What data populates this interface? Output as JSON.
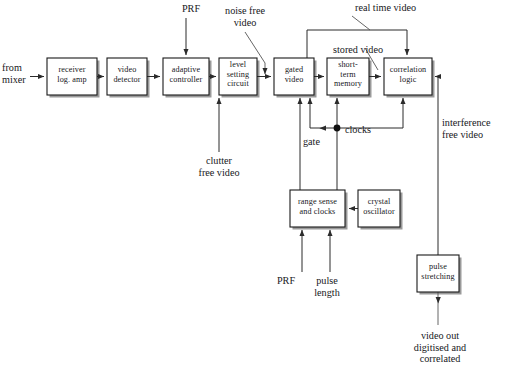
{
  "diagram": {
    "canvas": {
      "width": 507,
      "height": 387
    },
    "colors": {
      "background": "#ffffff",
      "box_stroke": "#1a1a1a",
      "box_fill": "#ffffff",
      "box_shadow": "#9a9a9a",
      "wire": "#2b2b2b",
      "text": "#17171b"
    },
    "blocks": [
      {
        "id": "receiver",
        "label": "receiver\nlog. amp",
        "x": 47,
        "y": 58,
        "w": 50,
        "h": 37
      },
      {
        "id": "detector",
        "label": "video\ndetector",
        "x": 107,
        "y": 58,
        "w": 40,
        "h": 37
      },
      {
        "id": "adaptive",
        "label": "adaptive\ncontroller",
        "x": 163,
        "y": 58,
        "w": 46,
        "h": 37
      },
      {
        "id": "levelset",
        "label": "level\nsetting\ncircuit",
        "x": 219,
        "y": 58,
        "w": 38,
        "h": 37
      },
      {
        "id": "gated",
        "label": "gated\nvideo",
        "x": 274,
        "y": 58,
        "w": 40,
        "h": 37
      },
      {
        "id": "shortterm",
        "label": "short-\nterm\nmemory",
        "x": 327,
        "y": 58,
        "w": 42,
        "h": 37
      },
      {
        "id": "correlation",
        "label": "correlation\nlogic",
        "x": 384,
        "y": 58,
        "w": 48,
        "h": 37
      },
      {
        "id": "rangesense",
        "label": "range sense\nand clocks",
        "x": 290,
        "y": 190,
        "w": 55,
        "h": 37
      },
      {
        "id": "crystal",
        "label": "crystal\noscillator",
        "x": 358,
        "y": 190,
        "w": 42,
        "h": 37
      },
      {
        "id": "pulsestr",
        "label": "pulse\nstretching",
        "x": 417,
        "y": 255,
        "w": 42,
        "h": 37
      }
    ],
    "annotations": [
      {
        "id": "from-mixer",
        "text": "from\nmixer",
        "x": 2,
        "y": 62,
        "w": 42,
        "align": "left"
      },
      {
        "id": "prf-top",
        "text": "PRF",
        "x": 172,
        "y": 3,
        "w": 38,
        "align": "center"
      },
      {
        "id": "noise-free-video",
        "text": "noise free\nvideo",
        "x": 214,
        "y": 5,
        "w": 62,
        "align": "center"
      },
      {
        "id": "real-time-video",
        "text": "real time video",
        "x": 355,
        "y": 2,
        "w": 84,
        "align": "left"
      },
      {
        "id": "stored-video",
        "text": "stored video",
        "x": 333,
        "y": 44,
        "w": 70,
        "align": "left"
      },
      {
        "id": "clutter-free-video",
        "text": "clutter\nfree video",
        "x": 185,
        "y": 155,
        "w": 68,
        "align": "center"
      },
      {
        "id": "gate",
        "text": "gate",
        "x": 293,
        "y": 138,
        "w": 30,
        "align": "left"
      },
      {
        "id": "clocks",
        "text": "clocks",
        "x": 345,
        "y": 124,
        "w": 40,
        "align": "left"
      },
      {
        "id": "interference-free",
        "text": "interference\nfree video",
        "x": 442,
        "y": 117,
        "w": 64,
        "align": "left"
      },
      {
        "id": "prf-bottom",
        "text": "PRF",
        "x": 270,
        "y": 275,
        "w": 32,
        "align": "center"
      },
      {
        "id": "pulse-length",
        "text": "pulse\nlength",
        "x": 307,
        "y": 275,
        "w": 40,
        "align": "center"
      },
      {
        "id": "video-out",
        "text": "video out\ndigitised and\ncorrelated",
        "x": 398,
        "y": 330,
        "w": 84,
        "align": "center"
      }
    ],
    "signal_flow": [
      "from mixer -> receiver log. amp",
      "receiver log. amp -> video detector",
      "video detector -> adaptive controller",
      "adaptive controller -> level setting circuit",
      "level setting circuit -> gated video (noise free video)",
      "gated video -> short-term memory",
      "short-term memory -> correlation logic (stored video)",
      "gated video -> correlation logic top (real time video)",
      "PRF -> adaptive controller (top)",
      "clutter free video -> level setting circuit (bottom)",
      "crystal oscillator -> range sense and clocks",
      "PRF -> range sense and clocks (bottom)",
      "pulse length -> range sense and clocks (bottom)",
      "range sense and clocks -> gated video (gate)",
      "range sense and clocks -> clocks bus -> gated video / short-term memory / correlation logic",
      "correlation logic -> pulse stretching (interference free video)",
      "pulse stretching -> video out digitised and correlated"
    ]
  }
}
